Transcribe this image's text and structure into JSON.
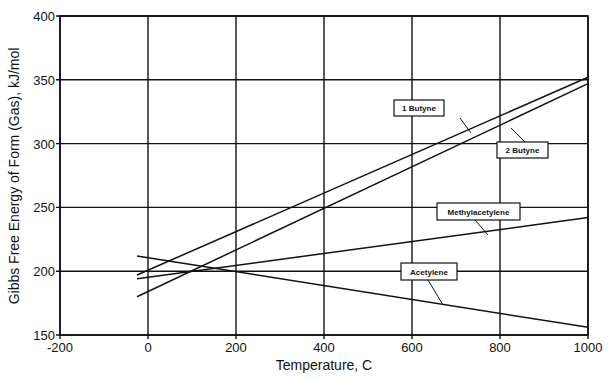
{
  "chart_data": {
    "type": "line",
    "title": "",
    "xlabel": "Temperature, C",
    "ylabel": "Gibbs Free Energy of Form (Gas), kJ/mol",
    "xlim": [
      -200,
      1000
    ],
    "ylim": [
      150,
      400
    ],
    "x_ticks": [
      "-200",
      "0",
      "200",
      "400",
      "600",
      "800",
      "1000"
    ],
    "y_ticks": [
      "150",
      "200",
      "250",
      "300",
      "350",
      "400"
    ],
    "grid": true,
    "legend": "inline labels with leader lines",
    "x": [
      -25,
      1000
    ],
    "series": [
      {
        "name": "1 Butyne",
        "values": [
          197,
          352
        ],
        "label_box": {
          "x": 394,
          "y": 100,
          "w": 50,
          "h": 16,
          "lx1": 460,
          "ly1": 118,
          "lx2": 471,
          "ly2": 133
        }
      },
      {
        "name": "2 Butyne",
        "values": [
          180,
          347
        ],
        "label_box": {
          "x": 497,
          "y": 142,
          "w": 51,
          "h": 16,
          "lx1": 511,
          "ly1": 128,
          "lx2": 525,
          "ly2": 142
        }
      },
      {
        "name": "Methylacetylene",
        "values": [
          194,
          242
        ],
        "label_box": {
          "x": 437,
          "y": 203,
          "w": 83,
          "h": 17,
          "lx1": 475,
          "ly1": 220,
          "lx2": 488,
          "ly2": 235
        }
      },
      {
        "name": "Acetylene",
        "values": [
          212,
          156
        ],
        "label_box": {
          "x": 401,
          "y": 263,
          "w": 56,
          "h": 17,
          "lx1": 428,
          "ly1": 280,
          "lx2": 443,
          "ly2": 305
        }
      }
    ]
  }
}
